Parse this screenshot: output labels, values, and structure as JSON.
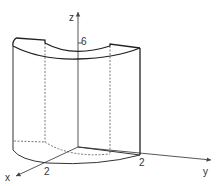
{
  "diagram": {
    "type": "3d-solid-sketch",
    "axes": {
      "x": {
        "label": "x",
        "tick_label": "2"
      },
      "y": {
        "label": "y",
        "tick_label": "2"
      },
      "z": {
        "label": "z",
        "tick_label": "6"
      }
    },
    "colors": {
      "line": "#333333",
      "background": "#ffffff"
    }
  }
}
